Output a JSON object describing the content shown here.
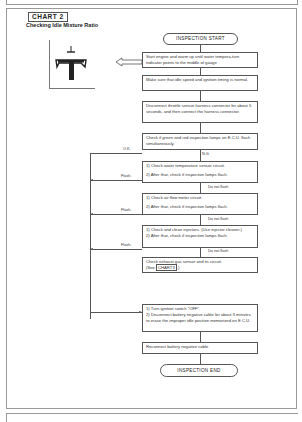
{
  "chart_tag": "CHART 2",
  "chart_title": "Checking Idle Mixture Ratio",
  "flow": {
    "start": "INSPECTION START",
    "end": "INSPECTION END",
    "steps": {
      "s1": "Start engine and warm up until water tempera-ture indicator points to the middle of gauge",
      "s2": "Make sure that idle speed and ignition timing is normal.",
      "s3": "Disconnect throttle sensor harness connector for about 5 seconds, and then connect the harness connector.",
      "s4": "Check if green and red inspection lamps on E.C.U. flash simultaneously.",
      "s5a": "1) Check water temperature sensor circuit.",
      "s5b": "2) After that, check if inspection lamps flash.",
      "s6a": "1) Check air flow meter circuit.",
      "s6b": "2) After that, check if inspection lamps flash.",
      "s7a": "1) Check and clean injectors. (Use injector cleaner.)",
      "s7b": "2) After that, check if inspection lamps flash.",
      "s8a": "Check exhaust gas sensor and its circuit.",
      "s8b_pre": "(See",
      "s8b_ref": "CHART3",
      "s8b_post": ".)",
      "s9a": "1) Turn ignition switch \"OFF\".",
      "s9b": "2) Disconnect battery negative cable for about 3 minutes to erase the improper idle position memorized on E.C.U.",
      "s10": "Reconnect battery negative cable."
    },
    "labels": {
      "ok": "O.K.",
      "ng": "N.G.",
      "flash1": "Flash.",
      "flash2": "Flash.",
      "flash3": "Flash.",
      "dnf1": "Do not flash",
      "dnf2": "Do not flash",
      "dnf3": "Do not flash"
    }
  },
  "illustration": {
    "icon": "idle-mixture-adjust-screw-icon"
  }
}
